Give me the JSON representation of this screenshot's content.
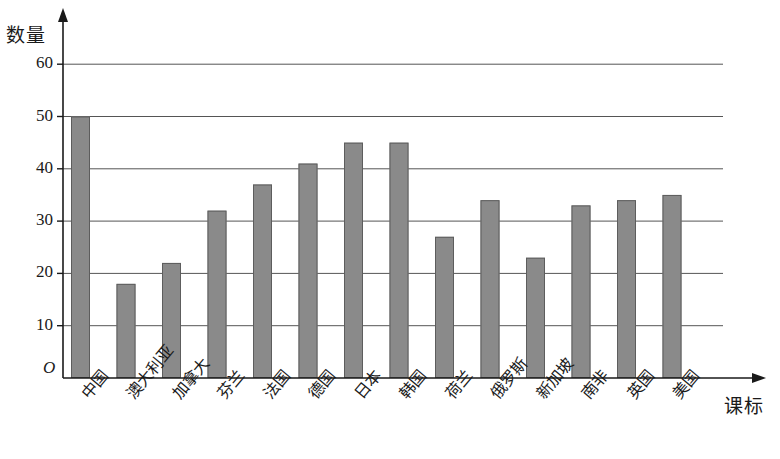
{
  "chart_data": {
    "type": "bar",
    "title": "",
    "ylabel": "数量",
    "xlabel": "课标",
    "origin_label": "O",
    "categories": [
      "中国",
      "澳大利亚",
      "加拿大",
      "芬兰",
      "法国",
      "德国",
      "日本",
      "韩国",
      "荷兰",
      "俄罗斯",
      "新加坡",
      "南非",
      "英国",
      "美国"
    ],
    "values": [
      50,
      18,
      22,
      32,
      37,
      41,
      45,
      45,
      27,
      34,
      23,
      33,
      34,
      35
    ],
    "ytick_labels": [
      "10",
      "20",
      "30",
      "40",
      "50",
      "60"
    ],
    "ytick_values": [
      10,
      20,
      30,
      40,
      50,
      60
    ],
    "ylim": [
      0,
      65
    ],
    "grid": "horizontal",
    "legend": "none",
    "bar_color": "#8a8a8a",
    "axis_color": "#1a1a1a",
    "grid_color": "#555555"
  },
  "geometry": {
    "plot_left": 63,
    "plot_bottom": 378,
    "plot_right": 723,
    "axis_top": 8,
    "x_axis_end": 766,
    "px_per_unit": 5.23,
    "bar_width": 19,
    "bar_pitch": 45.5,
    "first_bar_left": 71
  }
}
